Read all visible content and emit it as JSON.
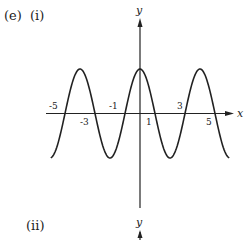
{
  "labels": {
    "part": "(e)",
    "sub1": "(i)",
    "sub2": "(ii)"
  },
  "chart_data": [
    {
      "type": "line",
      "title": "(e) (i)",
      "xlabel": "x",
      "ylabel": "y",
      "function": "y = cos(pi*x/2)",
      "x_tick_labels_above": [
        "-5",
        "-1",
        "3"
      ],
      "x_tick_labels_below": [
        "-3",
        "1",
        "5"
      ],
      "zeros": [
        -5,
        -3,
        -1,
        1,
        3,
        5
      ],
      "maxima_x": [
        -4,
        0,
        4
      ],
      "minima_x": [
        -2,
        2
      ],
      "xlim": [
        -6,
        6
      ],
      "grid": false,
      "legend": null
    },
    {
      "type": "line",
      "title": "(ii)",
      "xlabel": "",
      "ylabel": "y"
    }
  ]
}
